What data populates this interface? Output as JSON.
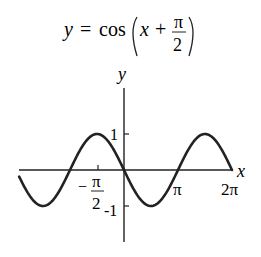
{
  "chart_data": {
    "type": "line",
    "title_parts": {
      "lhs": "y",
      "eq": "=",
      "fn": "cos",
      "arg_var": "x",
      "plus": "+",
      "frac_num": "π",
      "frac_den": "2"
    },
    "xlabel": "x",
    "ylabel": "y",
    "x_ticks": [
      {
        "value": -1.5708,
        "label_num": "π",
        "label_den": "2",
        "label_sign": "−"
      },
      {
        "value": 3.1416,
        "label": "π"
      },
      {
        "value": 6.2832,
        "label": "2π"
      }
    ],
    "y_ticks": [
      {
        "value": 1,
        "label": "1"
      },
      {
        "value": -1,
        "label": "-1"
      }
    ],
    "xlim": [
      -6.1,
      6.2832
    ],
    "ylim": [
      -2.0,
      2.6
    ],
    "grid": false,
    "legend": null,
    "series": [
      {
        "name": "cos(x + π/2)",
        "function": "-sin(x)",
        "x_start": -6.1,
        "x_end": 6.2832
      }
    ]
  }
}
